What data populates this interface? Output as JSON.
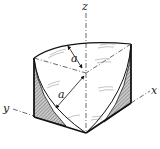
{
  "diagram": {
    "axes": {
      "x_label": "x",
      "y_label": "y",
      "z_label": "z"
    },
    "dimensions": [
      {
        "label": "a",
        "position": "upper"
      },
      {
        "label": "a",
        "position": "lower"
      }
    ],
    "colors": {
      "line": "#111111",
      "hatch_fill": "#555555",
      "background": "#ffffff"
    }
  }
}
